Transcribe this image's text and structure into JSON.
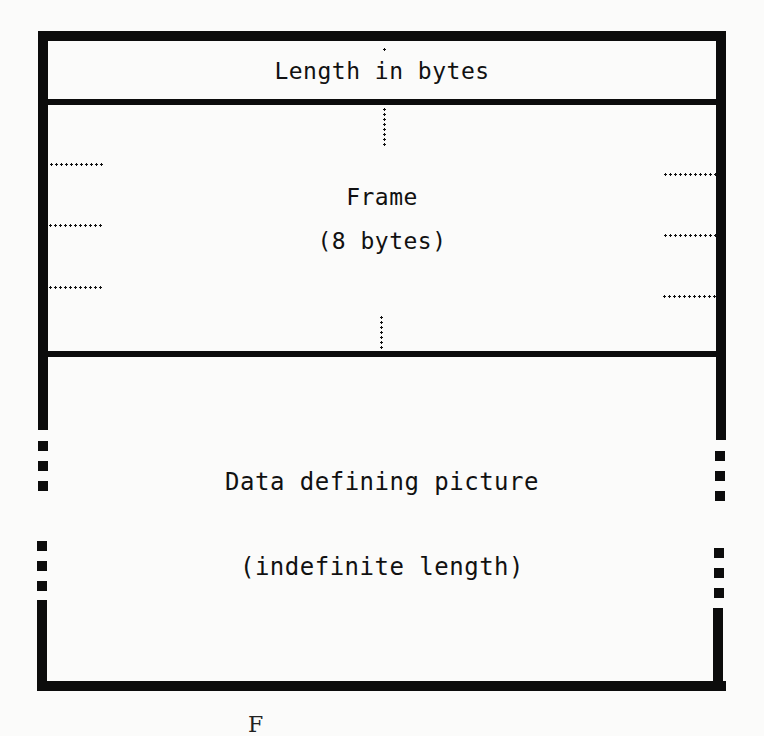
{
  "diagram": {
    "type": "record-layout",
    "sections": [
      {
        "id": "length",
        "label": "Length in bytes"
      },
      {
        "id": "frame",
        "label_line1": "Frame",
        "label_line2": "(8 bytes)"
      },
      {
        "id": "data",
        "label_line1": "Data defining picture",
        "label_line2": "(indefinite length)"
      }
    ],
    "caption_partial": "F",
    "colors": {
      "ink": "#0c0c0c",
      "paper": "#fbfbfa"
    }
  }
}
